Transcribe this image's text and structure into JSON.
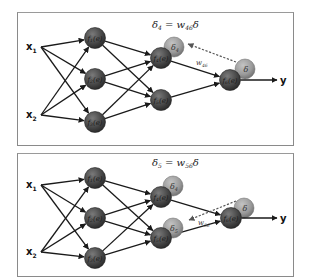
{
  "panels": [
    {
      "id": "top",
      "equation": {
        "lhs": "δ",
        "lhs_sub": "4",
        "eq": " = w",
        "w_sub": "46",
        "rhs": "δ"
      },
      "inputs": [
        {
          "label": "x",
          "sub": "1"
        },
        {
          "label": "x",
          "sub": "2"
        }
      ],
      "layer1": [
        {
          "label": "f",
          "sub": "1",
          "arg": "(e)"
        },
        {
          "label": "f",
          "sub": "2",
          "arg": "(e)"
        },
        {
          "label": "f",
          "sub": "3",
          "arg": "(e)"
        }
      ],
      "layer2": [
        {
          "label": "f",
          "sub": "4",
          "arg": "(e)"
        },
        {
          "label": "f",
          "sub": "5",
          "arg": "(e)"
        }
      ],
      "output": {
        "label": "f",
        "sub": "6",
        "arg": "(e)"
      },
      "output_label": "y",
      "error_nodes": [
        {
          "label": "δ",
          "sub": "4",
          "attached_to": "f4"
        },
        {
          "label": "δ",
          "sub": "",
          "attached_to": "f6"
        }
      ],
      "backprop_weight": {
        "label": "w",
        "sub": "46"
      }
    },
    {
      "id": "bottom",
      "equation": {
        "lhs": "δ",
        "lhs_sub": "5",
        "eq": " = w",
        "w_sub": "56",
        "rhs": "δ"
      },
      "inputs": [
        {
          "label": "x",
          "sub": "1"
        },
        {
          "label": "x",
          "sub": "2"
        }
      ],
      "layer1": [
        {
          "label": "f",
          "sub": "1",
          "arg": "(e)"
        },
        {
          "label": "f",
          "sub": "2",
          "arg": "(e)"
        },
        {
          "label": "f",
          "sub": "3",
          "arg": "(e)"
        }
      ],
      "layer2": [
        {
          "label": "f",
          "sub": "4",
          "arg": "(e)"
        },
        {
          "label": "f",
          "sub": "5",
          "arg": "(e)"
        }
      ],
      "output": {
        "label": "f",
        "sub": "6",
        "arg": "(e)"
      },
      "output_label": "y",
      "error_nodes": [
        {
          "label": "δ",
          "sub": "4",
          "attached_to": "f4"
        },
        {
          "label": "δ",
          "sub": "5",
          "attached_to": "f5"
        },
        {
          "label": "δ",
          "sub": "",
          "attached_to": "f6"
        }
      ],
      "backprop_weight": {
        "label": "w",
        "sub": "56"
      }
    }
  ],
  "colors": {
    "neuron_fill": "#4a4a4a",
    "neuron_highlight": "#7a7a7a",
    "error_fill": "#9a9a9a",
    "edge": "#1a1a1a",
    "dashed": "#555555",
    "border": "#8a8a8a"
  }
}
